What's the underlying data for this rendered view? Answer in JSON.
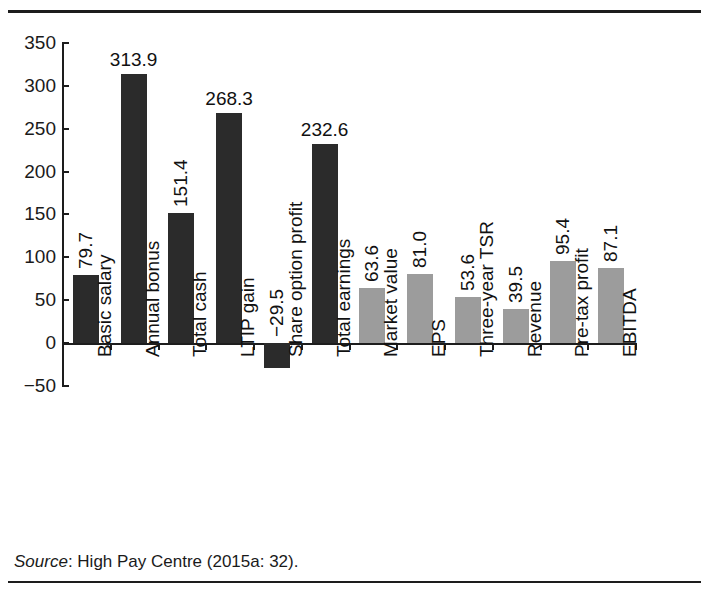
{
  "figure": {
    "title_clipped": "",
    "source_prefix": "Source",
    "source_text": ": High Pay Centre (2015a: 32)."
  },
  "chart_data": {
    "type": "bar",
    "title": "",
    "subtitle": "",
    "xlabel": "",
    "ylabel": "",
    "ylim": [
      -50,
      350
    ],
    "yticks": [
      350,
      300,
      250,
      200,
      150,
      100,
      50,
      0,
      -50
    ],
    "ytick_labels": [
      "350",
      "300",
      "250",
      "200",
      "150",
      "100",
      "50",
      "0",
      "−50"
    ],
    "grid": false,
    "legend": "none",
    "categories": [
      "Basic salary",
      "Annual bonus",
      "Total cash",
      "LTIP gain",
      "Share option profit",
      "Total earnings",
      "Market value",
      "EPS",
      "Three-year TSR",
      "Revenue",
      "Pre-tax profit",
      "EBITDA"
    ],
    "values": [
      79.7,
      313.9,
      151.4,
      268.3,
      -29.5,
      232.6,
      63.6,
      81.0,
      53.6,
      39.5,
      95.4,
      87.1
    ],
    "value_labels": [
      "79.7",
      "313.9",
      "151.4",
      "268.3",
      "−29.5",
      "232.6",
      "63.6",
      "81.0",
      "53.6",
      "39.5",
      "95.4",
      "87.1"
    ],
    "label_orientation": [
      "vertical",
      "horizontal",
      "vertical",
      "horizontal",
      "vertical",
      "horizontal",
      "vertical",
      "vertical",
      "vertical",
      "vertical",
      "vertical",
      "vertical"
    ],
    "series_colors": {
      "pay_measures": "#2b2b2b",
      "performance_measures": "#9c9c9c"
    },
    "group_of_bar": [
      "pay_measures",
      "pay_measures",
      "pay_measures",
      "pay_measures",
      "pay_measures",
      "pay_measures",
      "performance_measures",
      "performance_measures",
      "performance_measures",
      "performance_measures",
      "performance_measures",
      "performance_measures"
    ]
  }
}
